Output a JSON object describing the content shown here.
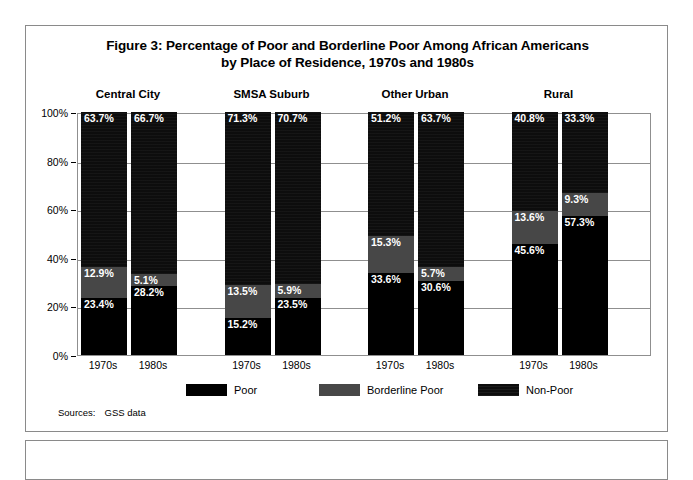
{
  "figure": {
    "title_line1": "Figure 3:  Percentage of Poor and Borderline Poor Among African Americans",
    "title_line2": "by Place of Residence, 1970s and 1980s",
    "sources_label": "Sources:",
    "sources_value": "GSS data"
  },
  "colors": {
    "poor": "#000000",
    "borderline_poor": "#474747",
    "non_poor": "#0d0d0d",
    "grid": "#8f8f8f",
    "frame": "#8a8a8a",
    "background": "#ffffff",
    "label_text": "#ffffff"
  },
  "chart_data": {
    "type": "bar",
    "stacked": true,
    "title": "Figure 3:  Percentage of Poor and Borderline Poor Among African Americans by Place of Residence, 1970s and 1980s",
    "xlabel": "",
    "ylabel": "",
    "ylim": [
      0,
      100
    ],
    "yticks": [
      "0%",
      "20%",
      "40%",
      "60%",
      "80%",
      "100%"
    ],
    "ytick_values": [
      0,
      20,
      40,
      60,
      80,
      100
    ],
    "grid": true,
    "legend_position": "bottom",
    "legend": [
      "Poor",
      "Borderline Poor",
      "Non-Poor"
    ],
    "groups": [
      "Central City",
      "SMSA Suburb",
      "Other Urban",
      "Rural"
    ],
    "categories": [
      "1970s",
      "1980s",
      "1970s",
      "1980s",
      "1970s",
      "1980s",
      "1970s",
      "1980s"
    ],
    "series": [
      {
        "name": "Poor",
        "values": [
          23.4,
          28.2,
          15.2,
          23.5,
          33.6,
          30.6,
          45.6,
          57.3
        ]
      },
      {
        "name": "Borderline Poor",
        "values": [
          12.9,
          5.1,
          13.5,
          5.9,
          15.3,
          5.7,
          13.6,
          9.3
        ]
      },
      {
        "name": "Non-Poor",
        "values": [
          63.7,
          66.7,
          71.3,
          70.7,
          51.2,
          63.7,
          40.8,
          33.3
        ]
      }
    ],
    "bars": [
      {
        "group": "Central City",
        "period": "1970s",
        "poor": "23.4%",
        "borderline": "12.9%",
        "nonpoor": "63.7%"
      },
      {
        "group": "Central City",
        "period": "1980s",
        "poor": "28.2%",
        "borderline": "5.1%",
        "nonpoor": "66.7%"
      },
      {
        "group": "SMSA Suburb",
        "period": "1970s",
        "poor": "15.2%",
        "borderline": "13.5%",
        "nonpoor": "71.3%"
      },
      {
        "group": "SMSA Suburb",
        "period": "1980s",
        "poor": "23.5%",
        "borderline": "5.9%",
        "nonpoor": "70.7%"
      },
      {
        "group": "Other Urban",
        "period": "1970s",
        "poor": "33.6%",
        "borderline": "15.3%",
        "nonpoor": "51.2%"
      },
      {
        "group": "Other Urban",
        "period": "1980s",
        "poor": "30.6%",
        "borderline": "5.7%",
        "nonpoor": "63.7%"
      },
      {
        "group": "Rural",
        "period": "1970s",
        "poor": "45.6%",
        "borderline": "13.6%",
        "nonpoor": "40.8%"
      },
      {
        "group": "Rural",
        "period": "1980s",
        "poor": "57.3%",
        "borderline": "9.3%",
        "nonpoor": "33.3%"
      }
    ]
  }
}
